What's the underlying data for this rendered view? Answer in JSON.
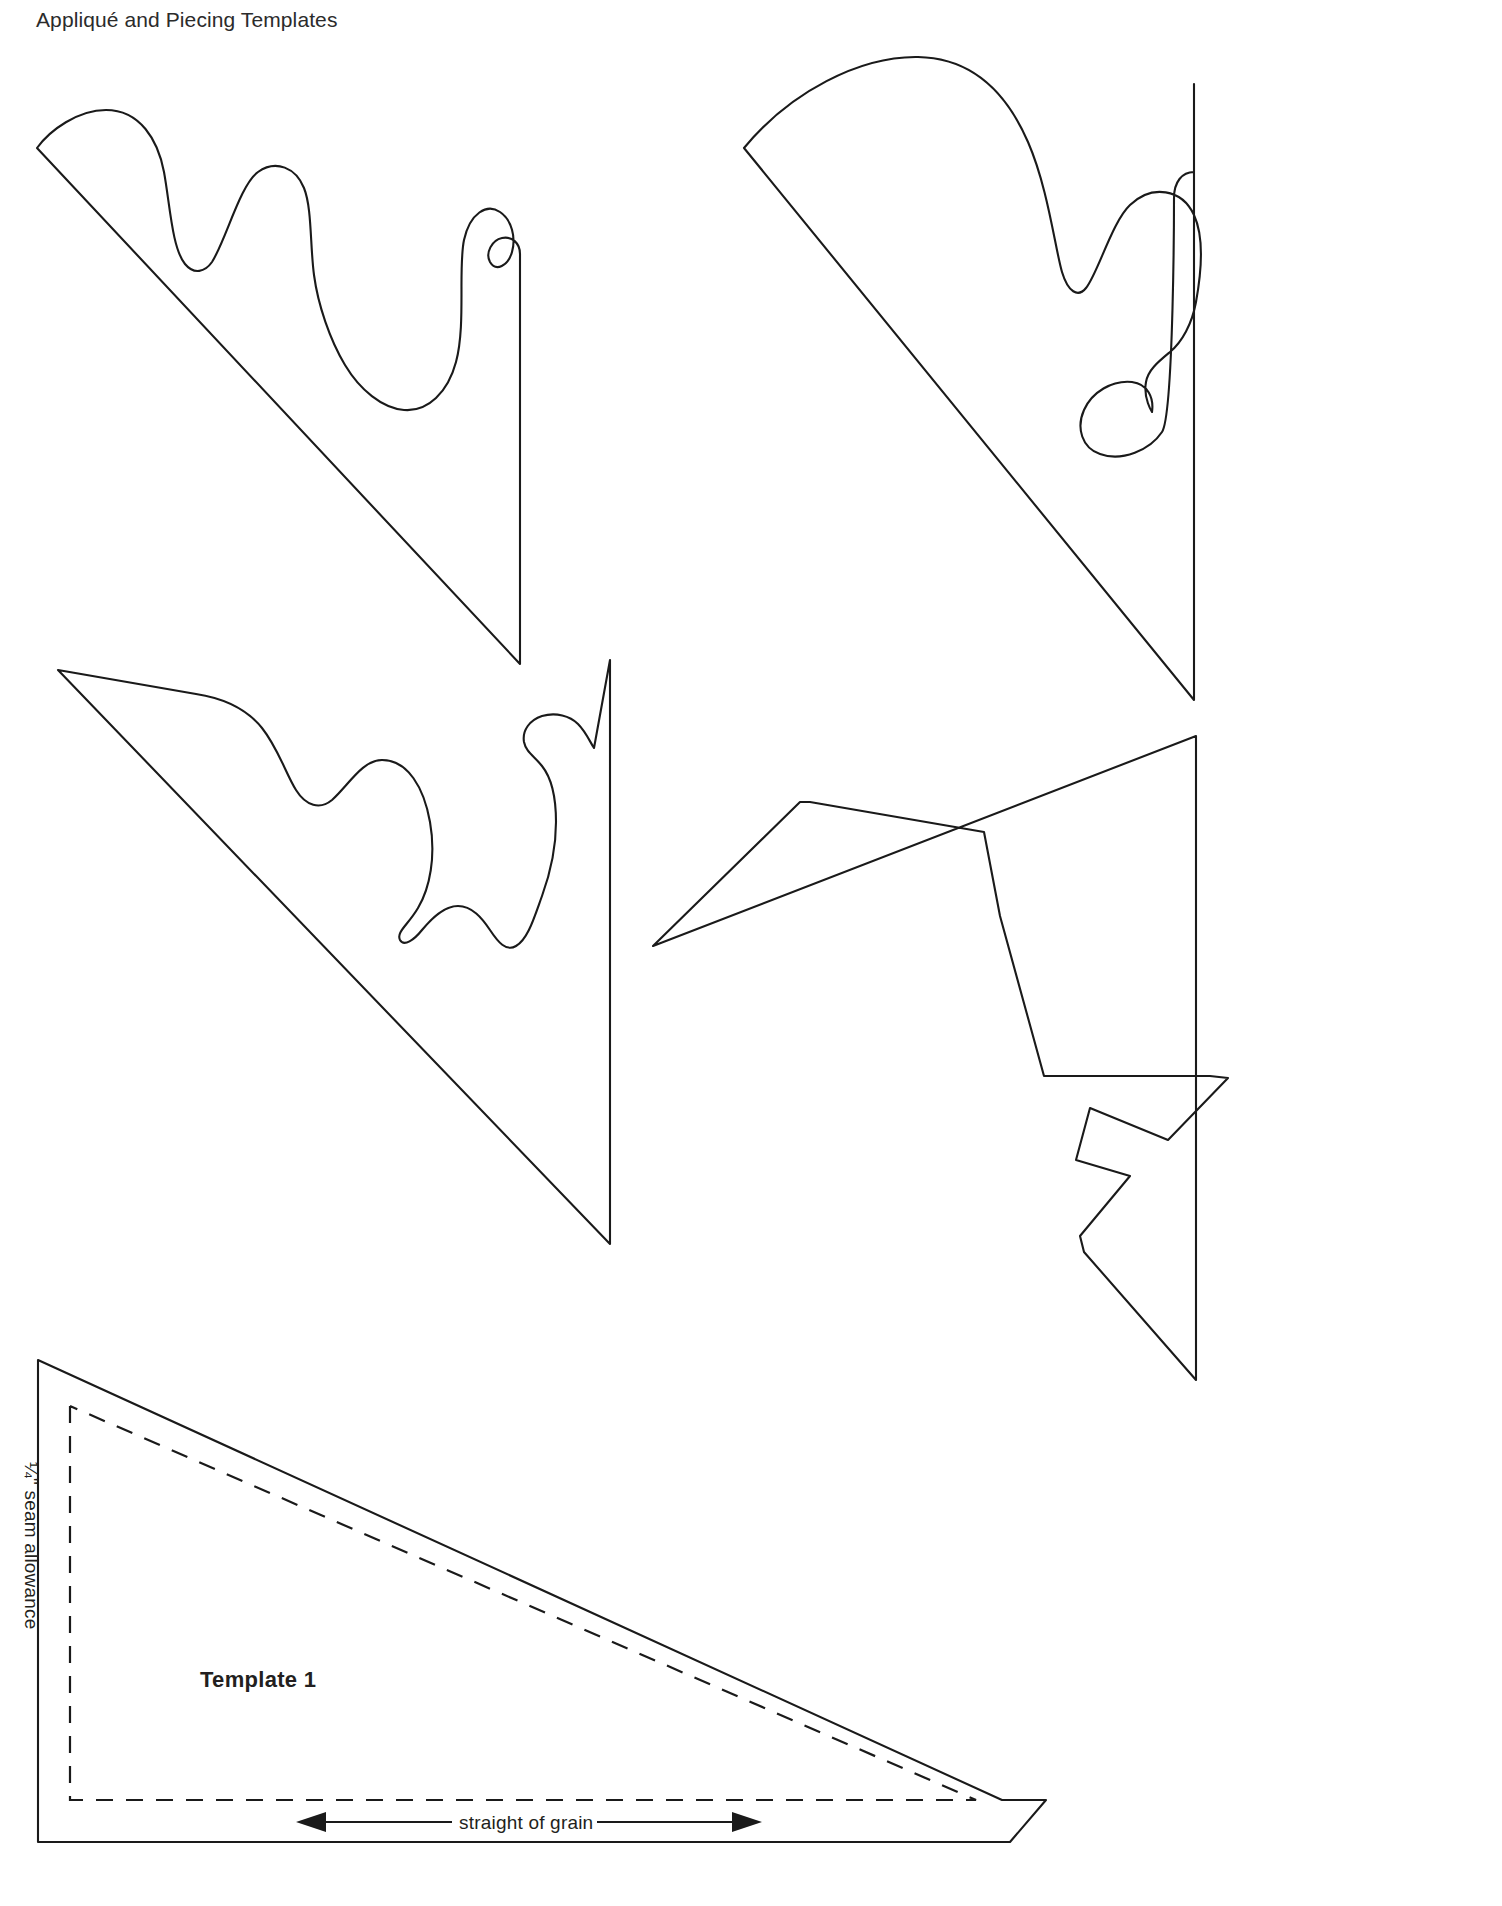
{
  "page": {
    "header": "Appliqué and Piecing Templates",
    "background_color": "#ffffff",
    "ink_color": "#1a1a1a",
    "width": 1502,
    "height": 1906
  },
  "labels": {
    "template_name": "Template 1",
    "seam_allowance": "¼\" seam allowance",
    "straight_of_grain": "straight of grain"
  },
  "templates": [
    {
      "id": "template-top-left",
      "name": "scalloped-wave-triangle-upper-left",
      "description": "Right triangle with wavy scalloped upper edge, hypotenuse running from upper-left down to lower-right, vertical right edge"
    },
    {
      "id": "template-top-right",
      "name": "scalloped-wave-triangle-upper-right",
      "description": "Right triangle with curved scalloped upper edge and hooked tail at right, vertical right edge"
    },
    {
      "id": "template-mid-left",
      "name": "pointed-scallop-triangle-middle-left",
      "description": "Right triangle with pointed and rounded scallops along the upper edge"
    },
    {
      "id": "template-mid-right",
      "name": "zigzag-angular-triangle-middle-right",
      "description": "Right triangle with angular zigzag stepped upper edge"
    },
    {
      "id": "template-1-bottom",
      "name": "plain-triangle-template-1",
      "description": "Plain right triangle with dashed quarter-inch seam allowance line and straight of grain arrow"
    }
  ],
  "annotations": {
    "grain_arrow": {
      "type": "double-headed-arrow",
      "direction": "horizontal"
    },
    "seam_line": {
      "style": "dashed",
      "offset_inches": 0.25
    }
  }
}
